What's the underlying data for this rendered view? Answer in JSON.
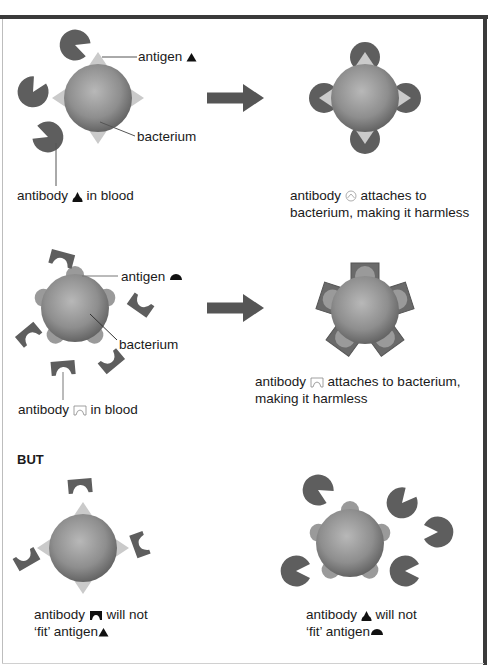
{
  "figure": {
    "colors": {
      "frame": "#3a3a3a",
      "antibody": "#5e5e5e",
      "antigen_triangle": "#c9c9c9",
      "antigen_bump": "#9a9a9a",
      "bacterium_light": "#b5b5b5",
      "bacterium_dark": "#5a5a5a",
      "arrow": "#555555"
    },
    "row1": {
      "left": {
        "antigen_label": "antigen",
        "bacterium_label": "bacterium",
        "antibody_label_pre": "antibody",
        "antibody_label_post": "in blood"
      },
      "arrow": "right-arrow",
      "right": {
        "caption_line1_pre": "antibody",
        "caption_line1_post": "attaches to",
        "caption_line2": "bacterium, making it harmless"
      }
    },
    "row2": {
      "left": {
        "antigen_label": "antigen",
        "bacterium_label": "bacterium",
        "antibody_label_pre": "antibody",
        "antibody_label_post": "in blood"
      },
      "arrow": "right-arrow",
      "right": {
        "caption_line1_pre": "antibody",
        "caption_line1_post": "attaches to bacterium,",
        "caption_line2": "making it harmless"
      }
    },
    "row3": {
      "heading": "BUT",
      "left": {
        "caption_line1_pre": "antibody",
        "caption_line1_post": "will not",
        "caption_line2_pre": "‘fit’ antigen"
      },
      "right": {
        "caption_line1_pre": "antibody",
        "caption_line1_post": "will not",
        "caption_line2_pre": "‘fit’ antigen"
      }
    }
  }
}
